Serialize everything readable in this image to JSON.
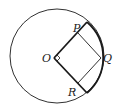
{
  "diagram": {
    "labels": {
      "O": "O",
      "P": "P",
      "Q": "Q",
      "R": "R"
    },
    "colors": {
      "stroke": "#1a1a1a",
      "background": "#ffffff"
    },
    "elements": [
      "circle",
      "sector OAB (bold)",
      "square OPQR",
      "right-angle marker at O"
    ]
  }
}
